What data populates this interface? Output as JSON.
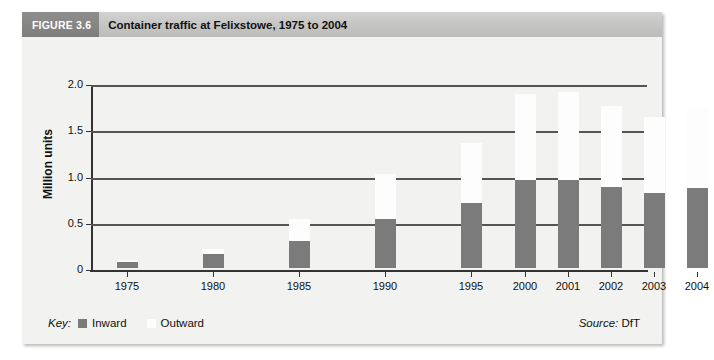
{
  "figure": {
    "number_label": "FIGURE 3.6",
    "title": "Container traffic at Felixstowe, 1975 to 2004"
  },
  "legend": {
    "key_label": "Key:",
    "entries": [
      {
        "label": "Inward",
        "color": "#7b7b7b"
      },
      {
        "label": "Outward",
        "color": "#fdfdfd"
      }
    ]
  },
  "source": {
    "prefix": "Source:",
    "value": "DfT"
  },
  "colors": {
    "panel_background": "#f2f2f0",
    "title_bar": "#c4c4c2",
    "figure_number_block": "#848482",
    "inward_bar": "#7b7b7b",
    "outward_bar": "#fdfdfd",
    "gridline": "#555555",
    "axis": "#333333"
  },
  "chart_data": {
    "type": "bar",
    "title": "Container traffic at Felixstowe, 1975 to 2004",
    "xlabel": "",
    "ylabel": "Million units",
    "ylim": [
      0,
      2.0
    ],
    "yticks": [
      0,
      0.5,
      1.0,
      1.5,
      2.0
    ],
    "ytick_labels": [
      "0",
      "0.5",
      "1.0",
      "1.5",
      "2.0"
    ],
    "grid": true,
    "stacked": true,
    "legend_position": "bottom-left",
    "categories": [
      "1975",
      "1980",
      "1985",
      "1990",
      "1995",
      "2000",
      "2001",
      "2002",
      "2003",
      "2004"
    ],
    "series": [
      {
        "name": "Inward",
        "color": "#7b7b7b",
        "values": [
          0.06,
          0.15,
          0.29,
          0.53,
          0.7,
          0.95,
          0.95,
          0.88,
          0.81,
          0.87
        ]
      },
      {
        "name": "Outward",
        "color": "#fdfdfd",
        "values": [
          0.03,
          0.06,
          0.24,
          0.49,
          0.65,
          0.93,
          0.95,
          0.87,
          0.82,
          0.86
        ]
      }
    ],
    "totals": [
      0.09,
      0.21,
      0.53,
      1.02,
      1.35,
      1.88,
      1.9,
      1.75,
      1.63,
      1.73
    ]
  }
}
